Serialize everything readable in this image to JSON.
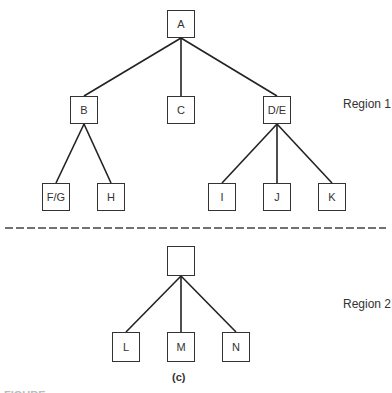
{
  "diagram": {
    "nodes": {
      "A": "A",
      "B": "B",
      "C": "C",
      "DE": "D/E",
      "FG": "F/G",
      "H": "H",
      "I": "I",
      "J": "J",
      "K": "K",
      "root2": "",
      "L": "L",
      "M": "M",
      "N": "N"
    },
    "edges": [
      [
        "A",
        "B"
      ],
      [
        "A",
        "C"
      ],
      [
        "A",
        "D/E"
      ],
      [
        "B",
        "F/G"
      ],
      [
        "B",
        "H"
      ],
      [
        "D/E",
        "I"
      ],
      [
        "D/E",
        "J"
      ],
      [
        "D/E",
        "K"
      ],
      [
        "root2",
        "L"
      ],
      [
        "root2",
        "M"
      ],
      [
        "root2",
        "N"
      ]
    ],
    "regions": {
      "r1": "Region 1",
      "r2": "Region 2"
    },
    "sublabel": "(c)",
    "caption": "FIGURE"
  }
}
